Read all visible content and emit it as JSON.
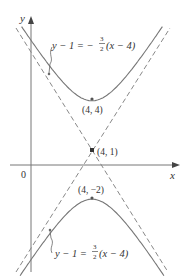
{
  "diagram": {
    "type": "hyperbola",
    "equation": "(y-1)^2/9 - (x-4)^2/4 = 1",
    "axes": {
      "x_label": "x",
      "y_label": "y",
      "origin_label": "0"
    },
    "points": [
      {
        "label": "(4, 4)",
        "x": 4,
        "y": 4,
        "role": "vertex-upper"
      },
      {
        "label": "(4, 1)",
        "x": 4,
        "y": 1,
        "role": "center"
      },
      {
        "label": "(4, −2)",
        "x": 4,
        "y": -2,
        "role": "vertex-lower"
      }
    ],
    "asymptotes": [
      {
        "label_lhs": "y − 1 = −",
        "frac_num": "3",
        "frac_den": "2",
        "label_rhs": "(x − 4)",
        "slope": -1.5
      },
      {
        "label_lhs": "y − 1 = ",
        "frac_num": "3",
        "frac_den": "2",
        "label_rhs": "(x − 4)",
        "slope": 1.5
      }
    ],
    "colors": {
      "curve": "#777777",
      "asymptote": "#888888",
      "axis": "#777777",
      "text": "#333333"
    }
  }
}
